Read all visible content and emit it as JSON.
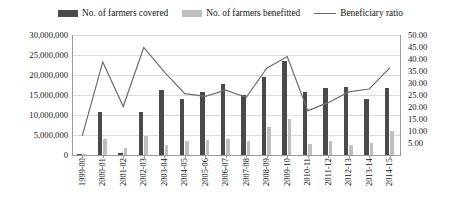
{
  "legend": {
    "items": [
      {
        "label": "No. of farmers covered",
        "marker": "bar-dark",
        "color": "#4a4a4a"
      },
      {
        "label": "No. of farmers benefitted",
        "marker": "bar-light",
        "color": "#bfbfbf"
      },
      {
        "label": "Beneficiary ratio",
        "marker": "line",
        "color": "#6e6e6e"
      }
    ]
  },
  "chart_data": {
    "type": "bar",
    "title": "",
    "subtitle": "",
    "xlabel": "",
    "ylabel": "",
    "grid": true,
    "legend_position": "top",
    "categories": [
      "1999-00",
      "2000-01",
      "2001-02",
      "2002-03",
      "2003-04",
      "2004-05",
      "2005-06",
      "2006-07",
      "2007-08",
      "2008-09",
      "2009-10",
      "2010-11",
      "2011-12",
      "2012-13",
      "2013-14",
      "2014-15"
    ],
    "left_axis": {
      "label": "",
      "ylim": [
        0,
        30000000
      ],
      "ticks": [
        0,
        5000000,
        10000000,
        15000000,
        20000000,
        25000000,
        30000000
      ],
      "tick_labels": [
        "0",
        "5,000,000",
        "10,000,000",
        "15,000,000",
        "20,000,000",
        "25,000,000",
        "30,000,000"
      ]
    },
    "right_axis": {
      "label": "",
      "ylim": [
        0,
        50
      ],
      "ticks": [
        5,
        10,
        15,
        20,
        25,
        30,
        35,
        40,
        45,
        50
      ],
      "tick_labels": [
        "5.00",
        "10.00",
        "15.00",
        "20.00",
        "25.00",
        "30.00",
        "35.00",
        "40.00",
        "45.00",
        "50.00"
      ]
    },
    "series": [
      {
        "name": "No. of farmers covered",
        "type": "bar",
        "axis": "left",
        "color": "#4a4a4a",
        "values": [
          300000,
          10800000,
          400000,
          10800000,
          16200000,
          14000000,
          15800000,
          17800000,
          15100000,
          19400000,
          23500000,
          15700000,
          16800000,
          16900000,
          14100000,
          16800000
        ]
      },
      {
        "name": "No. of farmers benefitted",
        "type": "bar",
        "axis": "left",
        "color": "#bfbfbf",
        "values": [
          100000,
          3900000,
          1700000,
          4700000,
          2600000,
          3400000,
          3700000,
          4100000,
          3400000,
          6900000,
          9100000,
          2700000,
          3400000,
          2600000,
          3100000,
          6100000
        ]
      },
      {
        "name": "Beneficiary ratio",
        "type": "line",
        "axis": "right",
        "color": "#6e6e6e",
        "values": [
          8.0,
          38.8,
          20.2,
          44.8,
          34.6,
          25.6,
          24.4,
          27.0,
          24.0,
          36.2,
          41.0,
          18.5,
          21.8,
          26.3,
          27.5,
          36.3
        ]
      }
    ]
  }
}
